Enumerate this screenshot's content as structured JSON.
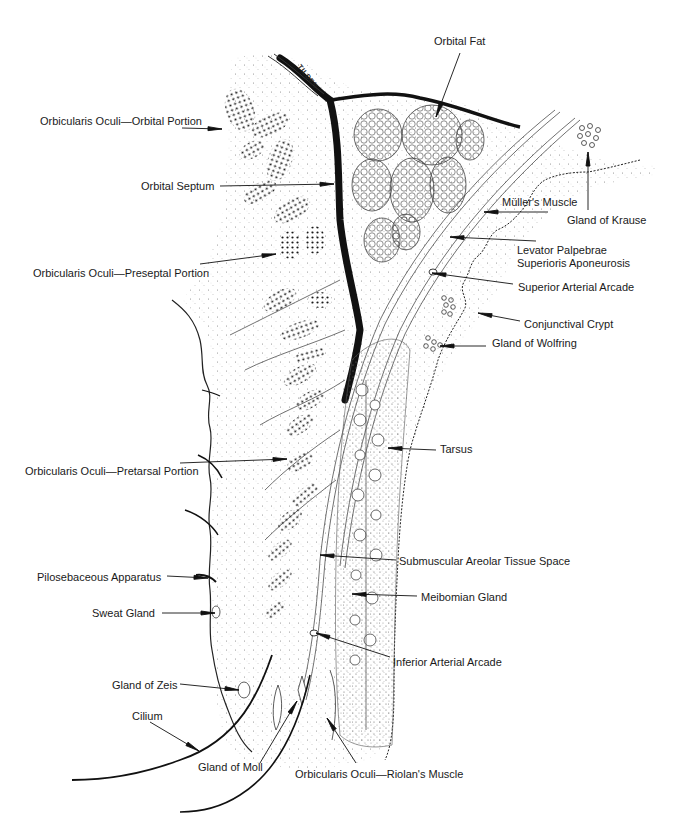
{
  "figure": {
    "signature": "TILDEN",
    "colors": {
      "ink": "#1a1a1a",
      "background": "#ffffff",
      "tissue_stipple": "#555555"
    }
  },
  "labels": [
    {
      "id": "orbicularis-orbital",
      "text": "Orbicularis Oculi—Orbital Portion",
      "x": 40,
      "y": 115,
      "align": "left",
      "arrow": {
        "x1": 182,
        "y1": 128,
        "x2": 222,
        "y2": 129
      }
    },
    {
      "id": "orbital-septum",
      "text": "Orbital Septum",
      "x": 141,
      "y": 180,
      "align": "left",
      "arrow": {
        "x1": 220,
        "y1": 186,
        "x2": 334,
        "y2": 184
      }
    },
    {
      "id": "orbicularis-preseptal",
      "text": "Orbicularis Oculi—Preseptal Portion",
      "x": 33,
      "y": 267,
      "align": "left",
      "arrow": {
        "x1": 200,
        "y1": 264,
        "x2": 276,
        "y2": 254
      }
    },
    {
      "id": "orbital-fat",
      "text": "Orbital Fat",
      "x": 434,
      "y": 35,
      "align": "left",
      "arrow": {
        "x1": 460,
        "y1": 53,
        "x2": 436,
        "y2": 117
      }
    },
    {
      "id": "gland-of-krause",
      "text": "Gland of Krause",
      "x": 567,
      "y": 214,
      "align": "left",
      "arrow": {
        "x1": 588,
        "y1": 210,
        "x2": 588,
        "y2": 152
      }
    },
    {
      "id": "mullers-muscle",
      "text": "Müller's Muscle",
      "x": 502,
      "y": 196,
      "align": "left",
      "arrow": {
        "x1": 548,
        "y1": 212,
        "x2": 484,
        "y2": 212
      }
    },
    {
      "id": "levator-aponeurosis",
      "text": "Levator Palpebrae\nSuperioris Aponeurosis",
      "x": 517,
      "y": 244,
      "align": "left",
      "arrow": {
        "x1": 536,
        "y1": 241,
        "x2": 450,
        "y2": 237
      }
    },
    {
      "id": "superior-arterial-arcade",
      "text": "Superior Arterial Arcade",
      "x": 518,
      "y": 281,
      "align": "left",
      "arrow": {
        "x1": 513,
        "y1": 284,
        "x2": 432,
        "y2": 273
      }
    },
    {
      "id": "conjunctival-crypt",
      "text": "Conjunctival Crypt",
      "x": 524,
      "y": 318,
      "align": "left",
      "arrow": {
        "x1": 520,
        "y1": 321,
        "x2": 478,
        "y2": 313
      }
    },
    {
      "id": "gland-of-wolfring",
      "text": "Gland of Wolfring",
      "x": 492,
      "y": 337,
      "align": "left",
      "arrow": {
        "x1": 486,
        "y1": 346,
        "x2": 440,
        "y2": 346
      }
    },
    {
      "id": "orbicularis-pretarsal",
      "text": "Orbicularis Oculi—Pretarsal Portion",
      "x": 25,
      "y": 465,
      "align": "left",
      "arrow": {
        "x1": 180,
        "y1": 463,
        "x2": 287,
        "y2": 459
      }
    },
    {
      "id": "tarsus",
      "text": "Tarsus",
      "x": 440,
      "y": 443,
      "align": "left",
      "arrow": {
        "x1": 436,
        "y1": 450,
        "x2": 388,
        "y2": 448
      }
    },
    {
      "id": "submuscular-areolar",
      "text": "Submuscular Areolar Tissue Space",
      "x": 399,
      "y": 555,
      "align": "left",
      "arrow": {
        "x1": 396,
        "y1": 560,
        "x2": 320,
        "y2": 555
      }
    },
    {
      "id": "pilosebaceous-apparatus",
      "text": "Pilosebaceous Apparatus",
      "x": 37,
      "y": 571,
      "align": "left",
      "arrow": {
        "x1": 167,
        "y1": 576,
        "x2": 208,
        "y2": 578
      }
    },
    {
      "id": "meibomian-gland",
      "text": "Meibomian Gland",
      "x": 421,
      "y": 591,
      "align": "left",
      "arrow": {
        "x1": 417,
        "y1": 596,
        "x2": 352,
        "y2": 594
      }
    },
    {
      "id": "sweat-gland",
      "text": "Sweat Gland",
      "x": 92,
      "y": 607,
      "align": "left",
      "arrow": {
        "x1": 162,
        "y1": 613,
        "x2": 215,
        "y2": 613
      }
    },
    {
      "id": "inferior-arterial-arcade",
      "text": "Inferior Arterial Arcade",
      "x": 393,
      "y": 656,
      "align": "left",
      "arrow": {
        "x1": 390,
        "y1": 657,
        "x2": 316,
        "y2": 633
      }
    },
    {
      "id": "gland-of-zeis",
      "text": "Gland of Zeis",
      "x": 112,
      "y": 679,
      "align": "left",
      "arrow": {
        "x1": 180,
        "y1": 684,
        "x2": 239,
        "y2": 690
      }
    },
    {
      "id": "cilium",
      "text": "Cilium",
      "x": 132,
      "y": 710,
      "align": "left",
      "arrow": {
        "x1": 150,
        "y1": 722,
        "x2": 199,
        "y2": 751
      }
    },
    {
      "id": "gland-of-moll",
      "text": "Gland of Moll",
      "x": 198,
      "y": 761,
      "align": "left",
      "arrow": {
        "x1": 260,
        "y1": 763,
        "x2": 297,
        "y2": 701
      }
    },
    {
      "id": "orbicularis-riolan",
      "text": "Orbicularis Oculi—Riolan's Muscle",
      "x": 295,
      "y": 768,
      "align": "left",
      "arrow": {
        "x1": 356,
        "y1": 763,
        "x2": 327,
        "y2": 718
      }
    }
  ]
}
